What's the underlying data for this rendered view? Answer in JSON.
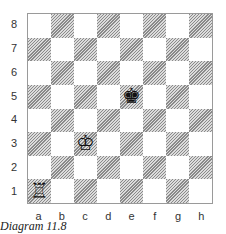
{
  "diagram": {
    "caption": "Diagram 11.8",
    "ranks": [
      "8",
      "7",
      "6",
      "5",
      "4",
      "3",
      "2",
      "1"
    ],
    "files": [
      "a",
      "b",
      "c",
      "d",
      "e",
      "f",
      "g",
      "h"
    ],
    "pieces": [
      {
        "square": "a1",
        "color": "white",
        "type": "rook",
        "glyph": "♖"
      },
      {
        "square": "c3",
        "color": "white",
        "type": "king",
        "glyph": "♔"
      },
      {
        "square": "e5",
        "color": "black",
        "type": "king",
        "glyph": "♚"
      }
    ]
  }
}
